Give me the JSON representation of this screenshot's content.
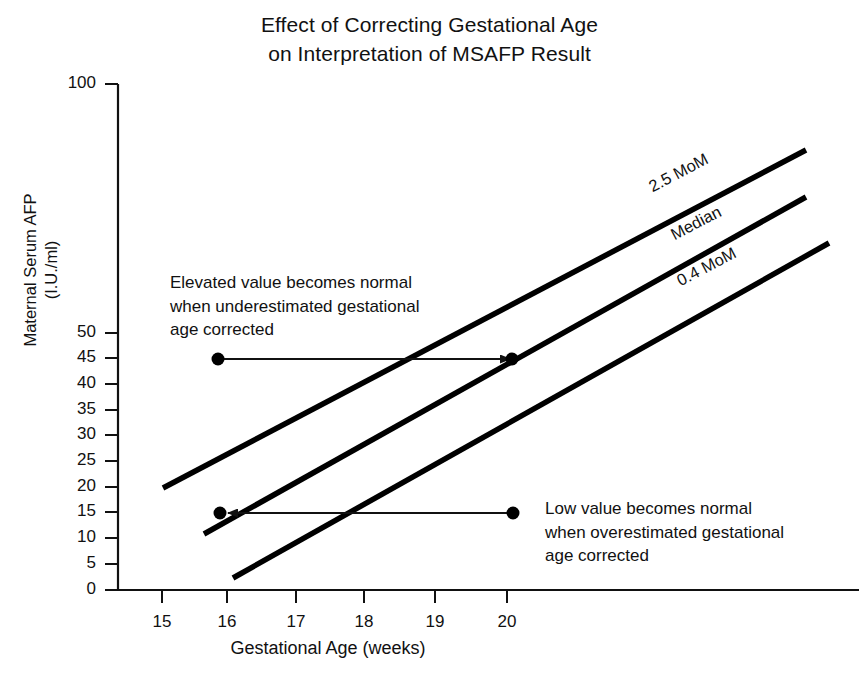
{
  "chart_data": {
    "type": "line",
    "title": "Effect of Correcting Gestational Age on Interpretation of MSAFP Result",
    "title_line1": "Effect of Correcting Gestational Age",
    "title_line2": "on Interpretation of MSAFP Result",
    "xlabel": "Gestational Age (weeks)",
    "ylabel": "Maternal Serum AFP",
    "ylabel_units": "(I.U./ml)",
    "xlim": [
      14.3,
      20.9
    ],
    "ylim": [
      0,
      100
    ],
    "grid": false,
    "legend_position": "inline-right-rotated",
    "y_ticks": [
      {
        "label": "100",
        "value": 100,
        "px": 84
      },
      {
        "label": "50",
        "value": 50,
        "px": 333
      },
      {
        "label": "45",
        "value": 45,
        "px": 358
      },
      {
        "label": "40",
        "value": 40,
        "px": 384
      },
      {
        "label": "35",
        "value": 35,
        "px": 410
      },
      {
        "label": "30",
        "value": 30,
        "px": 435
      },
      {
        "label": "25",
        "value": 25,
        "px": 461
      },
      {
        "label": "20",
        "value": 20,
        "px": 487
      },
      {
        "label": "15",
        "value": 15,
        "px": 512
      },
      {
        "label": "10",
        "value": 10,
        "px": 538
      },
      {
        "label": "5",
        "value": 5,
        "px": 564
      },
      {
        "label": "0",
        "value": 0,
        "px": 590
      }
    ],
    "x_ticks": [
      {
        "label": "15",
        "value": 15,
        "px": 162
      },
      {
        "label": "16",
        "value": 16,
        "px": 227
      },
      {
        "label": "17",
        "value": 17,
        "px": 296
      },
      {
        "label": "18",
        "value": 18,
        "px": 364
      },
      {
        "label": "19",
        "value": 19,
        "px": 435
      },
      {
        "label": "20",
        "value": 20,
        "px": 507
      }
    ],
    "series": [
      {
        "name": "2.5 MoM",
        "label": "2.5 MoM",
        "x_start": 15.0,
        "y_start": 20,
        "x_end": 20.95,
        "y_end": 77,
        "px": {
          "x1": 163,
          "y1": 488,
          "x2": 806,
          "y2": 150
        },
        "label_px": {
          "x": 650,
          "y": 178,
          "rotate": -27.5
        }
      },
      {
        "name": "Median",
        "label": "Median",
        "x_start": 15.6,
        "y_start": 11,
        "x_end": 20.95,
        "y_end": 66,
        "px": {
          "x1": 204,
          "y1": 534,
          "x2": 806,
          "y2": 197
        },
        "label_px": {
          "x": 672,
          "y": 226,
          "rotate": -27.5
        }
      },
      {
        "name": "0.4 MoM",
        "label": "0.4 MoM",
        "x_start": 16.05,
        "y_start": 2,
        "x_end": 21.25,
        "y_end": 57,
        "px": {
          "x1": 233,
          "y1": 578,
          "x2": 829,
          "y2": 243
        },
        "label_px": {
          "x": 678,
          "y": 272,
          "rotate": -27.5
        }
      }
    ],
    "points": [
      {
        "name": "elevated-uncorrected",
        "x": 15.95,
        "y": 45,
        "px": {
          "x": 218,
          "y": 359
        }
      },
      {
        "name": "elevated-corrected",
        "x": 20.0,
        "y": 45,
        "px": {
          "x": 512,
          "y": 359
        }
      },
      {
        "name": "low-corrected",
        "x": 16.0,
        "y": 15,
        "px": {
          "x": 220,
          "y": 513
        }
      },
      {
        "name": "low-uncorrected",
        "x": 20.0,
        "y": 15,
        "px": {
          "x": 513,
          "y": 513
        }
      }
    ],
    "arrows": [
      {
        "name": "elevated-correction-arrow",
        "direction": "right",
        "from_px": {
          "x": 224,
          "y": 359
        },
        "to_px": {
          "x": 510,
          "y": 359
        }
      },
      {
        "name": "low-correction-arrow",
        "direction": "left",
        "from_px": {
          "x": 508,
          "y": 513
        },
        "to_px": {
          "x": 228,
          "y": 513
        }
      }
    ],
    "annotations": [
      {
        "name": "elevated-annotation",
        "lines": [
          "Elevated value becomes normal",
          "when underestimated gestational",
          "age corrected"
        ],
        "px": {
          "x": 170,
          "y": 271
        }
      },
      {
        "name": "low-annotation",
        "lines": [
          "Low value becomes normal",
          "when overestimated gestational",
          "age corrected"
        ],
        "px": {
          "x": 545,
          "y": 497
        }
      }
    ],
    "colors": {
      "background": "#ffffff",
      "axis": "#111111",
      "series_line": "#000000",
      "text": "#111111"
    }
  }
}
